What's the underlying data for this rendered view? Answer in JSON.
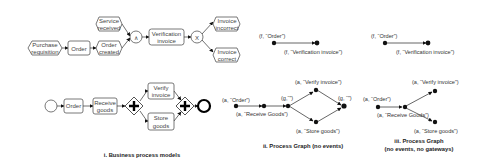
{
  "panel1": {
    "caption": "i. Business process models",
    "epc": {
      "purchase_requisition": [
        "Purchase",
        "requisition"
      ],
      "order": "Order",
      "order_created": [
        "Order",
        "created"
      ],
      "service_received": [
        "Service",
        "received"
      ],
      "and_connector": "∧",
      "verification_invoice": [
        "Verification",
        "invoice"
      ],
      "xor_connector": "X",
      "invoice_incorrect": [
        "Invoice",
        "incorrect"
      ],
      "invoice_correct": [
        "Invoice",
        "correct"
      ]
    },
    "bpmn": {
      "order": "Order",
      "receive_goods": [
        "Receive",
        "goods"
      ],
      "verify_invoice": [
        "Verify",
        "invoice"
      ],
      "store_goods": [
        "Store",
        "goods"
      ],
      "gateway_symbol": "✚"
    }
  },
  "panel2": {
    "caption": "ii. Process Graph (no events)",
    "top": {
      "n1": "(f, “Order”)",
      "n2": "(f, “Verification invoice”)"
    },
    "bottom": {
      "order": "(a, “Order”)",
      "receive": "(a, “Receive Goods”)",
      "g1": "(g,“”)",
      "verify": "(a, “Verify invoice”)",
      "store": "(a, “Store goods”)",
      "g2": "(g, “”)"
    }
  },
  "panel3": {
    "caption_line1": "iii. Process Graph",
    "caption_line2": "(no events, no gateways)",
    "top": {
      "n1": "(f, “Order”)",
      "n2": "(f, “Verification invoice”)"
    },
    "bottom": {
      "order": "(a, “Order”)",
      "receive": "(a, “Receive Goods”)",
      "verify": "(a, “Verify invoice”)",
      "store": "(a, “Store goods”)"
    }
  }
}
